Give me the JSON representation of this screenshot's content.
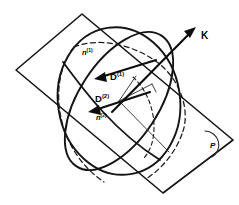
{
  "figure": {
    "name": "index-ellipsoid-wave-normal-diagram",
    "type": "geometric-optics-diagram",
    "background_color": "#ffffff",
    "line_color": "#141414"
  },
  "labels": {
    "wave_vector": {
      "base": "K",
      "superscript": ""
    },
    "displacement_1": {
      "base": "D",
      "superscript": "(1)"
    },
    "displacement_2": {
      "base": "D",
      "superscript": "(2)"
    },
    "index_1": {
      "base": "n",
      "superscript": "(1)"
    },
    "index_2": {
      "base": "n",
      "superscript": "(2)"
    },
    "plane": {
      "base": "P"
    }
  },
  "elements": {
    "sphere_outline": "ellipsoid-outer-boundary",
    "section_ellipse": "central-cross-section-ellipse",
    "hidden_arcs": "dashed-hidden-edges",
    "plane_quad": "plane-P-parallelogram",
    "axes_lines": "principal-axes-of-section",
    "corner_arc": "plane-corner-angle-arc"
  },
  "geometry": {
    "sphere_center": [
      119,
      101
    ],
    "sphere_rx": 61,
    "sphere_ry": 74,
    "plane_corners": [
      [
        82,
        14
      ],
      [
        16,
        70
      ],
      [
        163,
        193
      ],
      [
        233,
        140
      ]
    ],
    "k_arrow_from": [
      118,
      101
    ],
    "k_arrow_to": [
      196,
      27
    ],
    "d1_arrow_from": [
      155,
      62
    ],
    "d1_arrow_to": [
      96,
      79
    ],
    "d2_arrow_from": [
      148,
      93
    ],
    "d2_arrow_to": [
      89,
      112
    ]
  }
}
